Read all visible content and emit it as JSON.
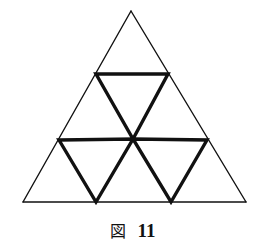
{
  "figure": {
    "caption_label": "図",
    "caption_number": "11",
    "stroke_color": "#111111",
    "background": "#ffffff",
    "outer_triangle": {
      "apex": [
        131,
        11
      ],
      "bottom_left": [
        23,
        202
      ],
      "bottom_right": [
        246,
        202
      ],
      "stroke_width": 1.4
    },
    "thin_lines": [
      {
        "name": "left-side",
        "from": [
          131,
          11
        ],
        "to": [
          23,
          202
        ]
      },
      {
        "name": "right-side",
        "from": [
          131,
          11
        ],
        "to": [
          246,
          202
        ]
      },
      {
        "name": "base",
        "from": [
          23,
          202
        ],
        "to": [
          246,
          202
        ]
      }
    ],
    "bold_triangles": [
      {
        "name": "top-inverted-triangle",
        "points": [
          [
            96,
            74
          ],
          [
            168,
            74
          ],
          [
            133,
            139
          ]
        ]
      },
      {
        "name": "bottom-left-inverted-triangle",
        "points": [
          [
            59,
            140
          ],
          [
            133,
            139
          ],
          [
            96,
            202
          ]
        ]
      },
      {
        "name": "bottom-right-inverted-triangle",
        "points": [
          [
            133,
            139
          ],
          [
            207,
            140
          ],
          [
            171,
            202
          ]
        ]
      }
    ],
    "bold_stroke_width": 3.4
  }
}
